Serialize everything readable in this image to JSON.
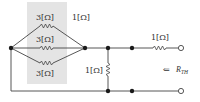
{
  "diagram": {
    "type": "circuit",
    "title": "",
    "colors": {
      "wire": "#444444",
      "shade": "#e4e4e4",
      "node": "#1a1a1a",
      "text": "#333333"
    },
    "parallel_group": {
      "resistors": [
        {
          "label": "3[Ω]"
        },
        {
          "label": "3[Ω]"
        },
        {
          "label": "3[Ω]"
        }
      ]
    },
    "wire_label": "1[Ω]",
    "shunt_resistor": {
      "label": "1[Ω]"
    },
    "series_resistor": {
      "label": "1[Ω]"
    },
    "thevenin": {
      "arrow": "⇐",
      "symbol": "R",
      "subscript": "TH"
    }
  }
}
